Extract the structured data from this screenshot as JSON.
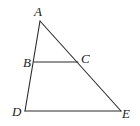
{
  "diagram": {
    "type": "geometry",
    "points": {
      "A": {
        "label": "A",
        "x": 40,
        "y": 21,
        "lx": 34,
        "ly": 16
      },
      "B": {
        "label": "B",
        "x": 34,
        "y": 62,
        "lx": 23,
        "ly": 67
      },
      "C": {
        "label": "C",
        "x": 78,
        "y": 62,
        "lx": 81,
        "ly": 63
      },
      "D": {
        "label": "D",
        "x": 25,
        "y": 111,
        "lx": 12,
        "ly": 116
      },
      "E": {
        "label": "E",
        "x": 121,
        "y": 111,
        "lx": 122,
        "ly": 118
      }
    },
    "segments": [
      {
        "name": "segment-AD",
        "from": "A",
        "to": "D"
      },
      {
        "name": "segment-AE",
        "from": "A",
        "to": "E"
      },
      {
        "name": "segment-DE",
        "from": "D",
        "to": "E"
      },
      {
        "name": "segment-BC",
        "from": "B",
        "to": "C"
      }
    ],
    "colors": {
      "line": "#2a2a2a",
      "label": "#222222",
      "background": "#ffffff"
    }
  }
}
